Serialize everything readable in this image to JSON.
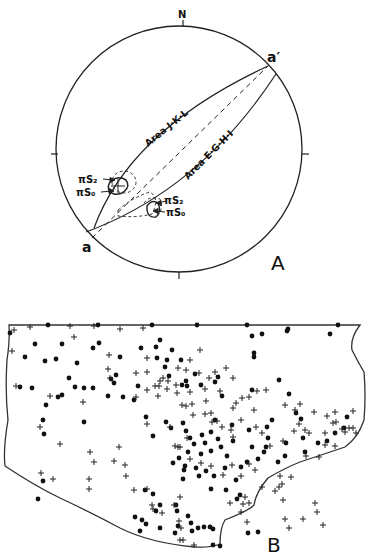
{
  "panelA": {
    "label": "A",
    "north_label": "N",
    "point_a": "a",
    "point_a_prime": "a′",
    "area1_label": "Area J·K·L",
    "area2_label": "Area E·G·H·I",
    "pi_s2_left": "πS₂",
    "pi_s0_left": "πS₀",
    "pi_s2_right": "πS₂",
    "pi_s0_right": "πS₀",
    "circle": {
      "cx": 179,
      "cy": 149,
      "r": 123
    }
  },
  "panelB": {
    "label": "B",
    "legend": {
      "dot": "filled circle",
      "cross": "plus sign"
    },
    "dots": [
      [
        10,
        333
      ],
      [
        48,
        325
      ],
      [
        98,
        325
      ],
      [
        152,
        325
      ],
      [
        197,
        325
      ],
      [
        247,
        325
      ],
      [
        288,
        329
      ],
      [
        338,
        325
      ],
      [
        35,
        344
      ],
      [
        62,
        344
      ],
      [
        93,
        348
      ],
      [
        99,
        343
      ],
      [
        25,
        357
      ],
      [
        45,
        361
      ],
      [
        56,
        359
      ],
      [
        77,
        363
      ],
      [
        160,
        340
      ],
      [
        156,
        347
      ],
      [
        141,
        348
      ],
      [
        157,
        358
      ],
      [
        120,
        357
      ],
      [
        181,
        360
      ],
      [
        167,
        360
      ],
      [
        172,
        350
      ],
      [
        165,
        367
      ],
      [
        111,
        379
      ],
      [
        116,
        375
      ],
      [
        114,
        383
      ],
      [
        69,
        378
      ],
      [
        75,
        387
      ],
      [
        84,
        388
      ],
      [
        93,
        388
      ],
      [
        20,
        387
      ],
      [
        32,
        388
      ],
      [
        62,
        395
      ],
      [
        46,
        405
      ],
      [
        58,
        397
      ],
      [
        108,
        396
      ],
      [
        138,
        386
      ],
      [
        186,
        381
      ],
      [
        182,
        385
      ],
      [
        215,
        382
      ],
      [
        187,
        386
      ],
      [
        201,
        385
      ],
      [
        222,
        396
      ],
      [
        252,
        390
      ],
      [
        195,
        374
      ],
      [
        169,
        376
      ],
      [
        218,
        377
      ],
      [
        287,
        331
      ],
      [
        254,
        353
      ],
      [
        254,
        357
      ],
      [
        279,
        380
      ],
      [
        252,
        336
      ],
      [
        262,
        334
      ],
      [
        289,
        394
      ],
      [
        330,
        334
      ],
      [
        43,
        420
      ],
      [
        84,
        422
      ],
      [
        123,
        397
      ],
      [
        134,
        400
      ],
      [
        171,
        428
      ],
      [
        215,
        420
      ],
      [
        232,
        425
      ],
      [
        249,
        430
      ],
      [
        267,
        427
      ],
      [
        272,
        420
      ],
      [
        296,
        413
      ],
      [
        301,
        419
      ],
      [
        347,
        417
      ],
      [
        335,
        433
      ],
      [
        344,
        428
      ],
      [
        318,
        443
      ],
      [
        327,
        441
      ],
      [
        44,
        434
      ],
      [
        43,
        481
      ],
      [
        38,
        499
      ],
      [
        146,
        417
      ],
      [
        153,
        436
      ],
      [
        166,
        422
      ],
      [
        183,
        423
      ],
      [
        186,
        431
      ],
      [
        202,
        435
      ],
      [
        190,
        438
      ],
      [
        211,
        432
      ],
      [
        218,
        439
      ],
      [
        221,
        447
      ],
      [
        227,
        456
      ],
      [
        233,
        441
      ],
      [
        211,
        451
      ],
      [
        201,
        454
      ],
      [
        194,
        444
      ],
      [
        205,
        443
      ],
      [
        188,
        452
      ],
      [
        179,
        458
      ],
      [
        173,
        463
      ],
      [
        185,
        466
      ],
      [
        184,
        470
      ],
      [
        183,
        479
      ],
      [
        196,
        468
      ],
      [
        199,
        476
      ],
      [
        206,
        471
      ],
      [
        214,
        476
      ],
      [
        225,
        468
      ],
      [
        241,
        467
      ],
      [
        247,
        462
      ],
      [
        258,
        459
      ],
      [
        252,
        447
      ],
      [
        236,
        480
      ],
      [
        264,
        452
      ],
      [
        266,
        447
      ],
      [
        268,
        438
      ],
      [
        286,
        443
      ],
      [
        303,
        438
      ],
      [
        285,
        456
      ],
      [
        278,
        462
      ],
      [
        305,
        452
      ],
      [
        211,
        489
      ],
      [
        226,
        490
      ],
      [
        240,
        495
      ],
      [
        237,
        499
      ],
      [
        145,
        490
      ],
      [
        153,
        494
      ],
      [
        160,
        505
      ],
      [
        156,
        511
      ],
      [
        176,
        505
      ],
      [
        177,
        511
      ],
      [
        188,
        516
      ],
      [
        191,
        523
      ],
      [
        198,
        528
      ],
      [
        192,
        531
      ],
      [
        204,
        527
      ],
      [
        210,
        527
      ],
      [
        213,
        529
      ],
      [
        178,
        526
      ],
      [
        175,
        533
      ],
      [
        160,
        528
      ],
      [
        146,
        524
      ],
      [
        135,
        517
      ],
      [
        142,
        520
      ],
      [
        140,
        531
      ],
      [
        213,
        545
      ],
      [
        220,
        546
      ],
      [
        248,
        533
      ],
      [
        258,
        532
      ]
    ],
    "crosses": [
      [
        14,
        330
      ],
      [
        30,
        327
      ],
      [
        70,
        326
      ],
      [
        94,
        326
      ],
      [
        120,
        329
      ],
      [
        143,
        328
      ],
      [
        74,
        337
      ],
      [
        109,
        355
      ],
      [
        12,
        351
      ],
      [
        16,
        386
      ],
      [
        50,
        396
      ],
      [
        83,
        402
      ],
      [
        108,
        369
      ],
      [
        110,
        378
      ],
      [
        136,
        373
      ],
      [
        147,
        358
      ],
      [
        147,
        372
      ],
      [
        136,
        397
      ],
      [
        147,
        390
      ],
      [
        155,
        386
      ],
      [
        159,
        386
      ],
      [
        167,
        389
      ],
      [
        178,
        368
      ],
      [
        190,
        360
      ],
      [
        200,
        350
      ],
      [
        209,
        378
      ],
      [
        215,
        372
      ],
      [
        226,
        368
      ],
      [
        233,
        378
      ],
      [
        242,
        398
      ],
      [
        257,
        391
      ],
      [
        266,
        390
      ],
      [
        295,
        410
      ],
      [
        314,
        412
      ],
      [
        305,
        430
      ],
      [
        325,
        433
      ],
      [
        353,
        411
      ],
      [
        345,
        432
      ],
      [
        353,
        428
      ],
      [
        158,
        396
      ],
      [
        163,
        378
      ],
      [
        186,
        370
      ],
      [
        199,
        373
      ],
      [
        205,
        389
      ],
      [
        190,
        392
      ],
      [
        160,
        381
      ],
      [
        168,
        381
      ],
      [
        176,
        385
      ],
      [
        177,
        393
      ],
      [
        182,
        405
      ],
      [
        192,
        404
      ],
      [
        186,
        406
      ],
      [
        193,
        415
      ],
      [
        205,
        414
      ],
      [
        206,
        401
      ],
      [
        220,
        391
      ],
      [
        236,
        403
      ],
      [
        249,
        397
      ],
      [
        254,
        410
      ],
      [
        212,
        422
      ],
      [
        241,
        420
      ],
      [
        285,
        405
      ],
      [
        300,
        404
      ],
      [
        327,
        416
      ],
      [
        336,
        422
      ],
      [
        342,
        429
      ],
      [
        147,
        424
      ],
      [
        170,
        427
      ],
      [
        187,
        438
      ],
      [
        175,
        446
      ],
      [
        180,
        447
      ],
      [
        211,
        413
      ],
      [
        217,
        421
      ],
      [
        233,
        408
      ],
      [
        233,
        437
      ],
      [
        178,
        447
      ],
      [
        190,
        459
      ],
      [
        201,
        463
      ],
      [
        222,
        427
      ],
      [
        231,
        430
      ],
      [
        256,
        427
      ],
      [
        262,
        433
      ],
      [
        270,
        446
      ],
      [
        283,
        441
      ],
      [
        294,
        431
      ],
      [
        40,
        427
      ],
      [
        60,
        444
      ],
      [
        90,
        452
      ],
      [
        94,
        462
      ],
      [
        119,
        447
      ],
      [
        114,
        461
      ],
      [
        126,
        476
      ],
      [
        125,
        465
      ],
      [
        134,
        490
      ],
      [
        147,
        489
      ],
      [
        152,
        505
      ],
      [
        153,
        509
      ],
      [
        162,
        513
      ],
      [
        174,
        505
      ],
      [
        179,
        521
      ],
      [
        181,
        528
      ],
      [
        180,
        540
      ],
      [
        183,
        540
      ],
      [
        194,
        545
      ],
      [
        230,
        503
      ],
      [
        243,
        504
      ],
      [
        241,
        512
      ],
      [
        247,
        522
      ],
      [
        279,
        487
      ],
      [
        249,
        464
      ],
      [
        280,
        476
      ],
      [
        299,
        424
      ],
      [
        333,
        423
      ],
      [
        309,
        433
      ],
      [
        335,
        412
      ],
      [
        41,
        473
      ],
      [
        53,
        479
      ],
      [
        89,
        479
      ],
      [
        89,
        489
      ],
      [
        180,
        497
      ],
      [
        211,
        466
      ],
      [
        223,
        475
      ],
      [
        232,
        465
      ],
      [
        241,
        476
      ],
      [
        255,
        470
      ],
      [
        245,
        497
      ],
      [
        249,
        503
      ],
      [
        262,
        487
      ],
      [
        275,
        491
      ],
      [
        282,
        484
      ],
      [
        283,
        500
      ],
      [
        291,
        477
      ],
      [
        306,
        456
      ],
      [
        319,
        457
      ],
      [
        325,
        445
      ],
      [
        335,
        446
      ],
      [
        349,
        428
      ],
      [
        356,
        433
      ],
      [
        315,
        503
      ],
      [
        317,
        512
      ],
      [
        285,
        519
      ],
      [
        289,
        528
      ],
      [
        303,
        519
      ],
      [
        323,
        525
      ]
    ]
  }
}
